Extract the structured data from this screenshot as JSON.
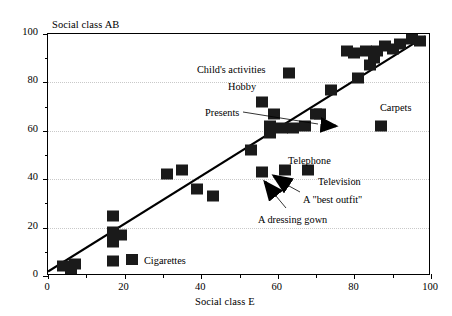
{
  "chart_data": {
    "type": "scatter",
    "title": "",
    "xlabel": "Social class E",
    "ylabel": "Social class AB",
    "xlim": [
      0,
      100
    ],
    "ylim": [
      0,
      100
    ],
    "grid": true,
    "xticks": [
      0,
      20,
      40,
      60,
      80,
      100
    ],
    "yticks": [
      0,
      20,
      40,
      60,
      80,
      100
    ],
    "xtick_labels": [
      "0",
      "20",
      "40",
      "60",
      "80",
      "100"
    ],
    "ytick_labels": [
      "0",
      "20",
      "40",
      "60",
      "80",
      "100"
    ],
    "minor_xticks": [
      10,
      30,
      50,
      70,
      90
    ],
    "minor_yticks": [
      10,
      30,
      50,
      70,
      90
    ],
    "legend_position": "none",
    "series": [
      {
        "name": "Household items",
        "marker": "filled-square",
        "color": "#1a1a1a",
        "points": [
          {
            "x": 4,
            "y": 4
          },
          {
            "x": 6,
            "y": 2
          },
          {
            "x": 7,
            "y": 5
          },
          {
            "x": 17,
            "y": 25
          },
          {
            "x": 17,
            "y": 18
          },
          {
            "x": 17,
            "y": 14
          },
          {
            "x": 17,
            "y": 6
          },
          {
            "x": 19,
            "y": 17
          },
          {
            "x": 31,
            "y": 42
          },
          {
            "x": 35,
            "y": 44
          },
          {
            "x": 39,
            "y": 36
          },
          {
            "x": 43,
            "y": 33
          },
          {
            "x": 53,
            "y": 52
          },
          {
            "x": 56,
            "y": 43
          },
          {
            "x": 56,
            "y": 72
          },
          {
            "x": 58,
            "y": 62
          },
          {
            "x": 58,
            "y": 59
          },
          {
            "x": 59,
            "y": 67
          },
          {
            "x": 61,
            "y": 61
          },
          {
            "x": 62,
            "y": 44
          },
          {
            "x": 63,
            "y": 84
          },
          {
            "x": 64,
            "y": 61
          },
          {
            "x": 67,
            "y": 62
          },
          {
            "x": 68,
            "y": 44
          },
          {
            "x": 70,
            "y": 67
          },
          {
            "x": 71,
            "y": 67
          },
          {
            "x": 74,
            "y": 77
          },
          {
            "x": 78,
            "y": 93
          },
          {
            "x": 80,
            "y": 92
          },
          {
            "x": 81,
            "y": 82
          },
          {
            "x": 83,
            "y": 93
          },
          {
            "x": 84,
            "y": 87
          },
          {
            "x": 85,
            "y": 90
          },
          {
            "x": 86,
            "y": 93
          },
          {
            "x": 87,
            "y": 62
          },
          {
            "x": 88,
            "y": 95
          },
          {
            "x": 90,
            "y": 94
          },
          {
            "x": 92,
            "y": 96
          },
          {
            "x": 95,
            "y": 98
          },
          {
            "x": 97,
            "y": 97
          }
        ]
      }
    ],
    "trendline": {
      "type": "linear",
      "x_start": 0,
      "y_start": 1,
      "x_end": 99,
      "y_end": 99
    },
    "annotations": [
      {
        "label": "Child's activities",
        "text_x": 197,
        "text_y": 65,
        "has_leader": false
      },
      {
        "label": "Hobby",
        "text_x": 228,
        "text_y": 82,
        "has_leader": false
      },
      {
        "label": "Presents",
        "text_x": 205,
        "text_y": 108,
        "has_leader": true
      },
      {
        "label": "Carpets",
        "text_x": 380,
        "text_y": 103,
        "has_leader": false
      },
      {
        "label": "Telephone",
        "text_x": 288,
        "text_y": 156,
        "has_leader": false
      },
      {
        "label": "Television",
        "text_x": 318,
        "text_y": 177,
        "has_leader": false
      },
      {
        "label": "A \"best outfit\"",
        "text_x": 303,
        "text_y": 195,
        "has_leader": true
      },
      {
        "label": "A dressing gown",
        "text_x": 258,
        "text_y": 215,
        "has_leader": true
      },
      {
        "label": "Cigarettes",
        "text_x": 144,
        "text_y": 256,
        "has_leader": false
      }
    ],
    "legend_items": [
      {
        "label": "Cigarettes",
        "swatch_x": 126,
        "swatch_y": 254
      }
    ]
  },
  "axes": {
    "y_title": "Social class AB",
    "x_title": "Social class E"
  }
}
